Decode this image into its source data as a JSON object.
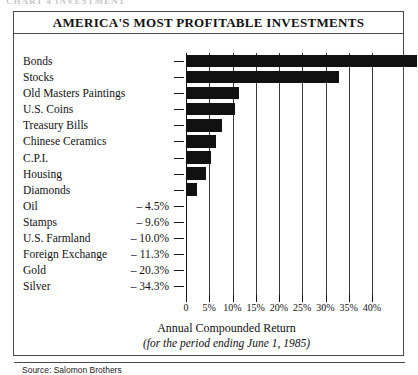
{
  "page": {
    "cut_off_header": "CHART 4  INVESTMENT"
  },
  "chart_data": {
    "type": "bar",
    "title": "AMERICA'S MOST PROFITABLE INVESTMENTS",
    "xlabel": "Annual Compounded Return",
    "subtitle": "(for the period ending June 1, 1985)",
    "ylabel": "",
    "orientation": "horizontal",
    "grid": true,
    "legend": "none",
    "xlim": [
      0,
      40
    ],
    "xticks": [
      0,
      5,
      10,
      15,
      20,
      25,
      30,
      35,
      40
    ],
    "xticklabels": [
      "0",
      "5%",
      "10%",
      "15%",
      "20%",
      "25%",
      "30%",
      "35%",
      "40%"
    ],
    "source": "Source: Salomon Brothers",
    "categories": [
      "Bonds",
      "Stocks",
      "Old Masters Paintings",
      "U.S. Coins",
      "Treasury Bills",
      "Chinese Ceramics",
      "C.P.I.",
      "Housing",
      "Diamonds",
      "Oil",
      "Stamps",
      "U.S. Farmland",
      "Foreign Exchange",
      "Gold",
      "Silver"
    ],
    "values": [
      49.4,
      32.7,
      11.2,
      10.3,
      7.6,
      6.2,
      5.2,
      4.1,
      2.2,
      -4.5,
      -9.6,
      -10.0,
      -11.3,
      -20.3,
      -34.3
    ],
    "negative_value_labels": [
      "",
      "",
      "",
      "",
      "",
      "",
      "",
      "",
      "",
      "– 4.5%",
      "– 9.6%",
      "– 10.0%",
      "– 11.3%",
      "– 20.3%",
      "– 34.3%"
    ],
    "bar_color": "#111111",
    "background_color": "#ffffff"
  }
}
